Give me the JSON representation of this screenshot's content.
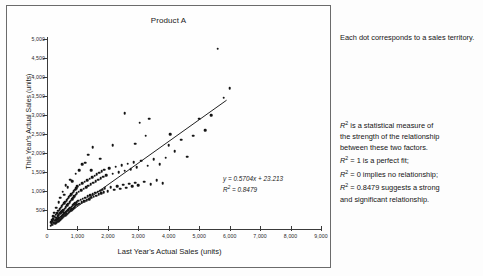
{
  "chart_data": {
    "type": "scatter",
    "title": "Product A",
    "xlabel": "Last Year's Actual Sales (units)",
    "ylabel": "This Year's Actual Sales (units)",
    "xlim": [
      0,
      9000
    ],
    "ylim": [
      0,
      5000
    ],
    "grid": false,
    "legend": "none",
    "x_ticks": [
      "0",
      "1,000",
      "2,000",
      "3,000",
      "4,000",
      "5,000",
      "6,000",
      "7,000",
      "8,000",
      "9,000"
    ],
    "x_tick_values": [
      0,
      1000,
      2000,
      3000,
      4000,
      5000,
      6000,
      7000,
      8000,
      9000
    ],
    "y_ticks": [
      "500",
      "1,000",
      "1,500",
      "2,000",
      "2,500",
      "3,000",
      "3,500",
      "4,000",
      "4,500",
      "5,000"
    ],
    "y_tick_values": [
      500,
      1000,
      1500,
      2000,
      2500,
      3000,
      3500,
      4000,
      4500,
      5000
    ],
    "trendline": {
      "slope": 0.5704,
      "intercept": 23.213,
      "r_squared": 0.8479,
      "equation_label": "y = 0.5704x + 23.213",
      "r2_label": "R² = 0.8479",
      "x_start": 150,
      "x_end": 5900
    },
    "series": [
      {
        "name": "Sales territories",
        "marker": "dot",
        "color": "#141414",
        "points": [
          [
            120,
            90
          ],
          [
            150,
            130
          ],
          [
            170,
            200
          ],
          [
            190,
            110
          ],
          [
            210,
            260
          ],
          [
            230,
            170
          ],
          [
            250,
            320
          ],
          [
            260,
            220
          ],
          [
            270,
            150
          ],
          [
            290,
            380
          ],
          [
            300,
            230
          ],
          [
            310,
            300
          ],
          [
            320,
            180
          ],
          [
            330,
            420
          ],
          [
            340,
            260
          ],
          [
            350,
            340
          ],
          [
            360,
            200
          ],
          [
            370,
            480
          ],
          [
            380,
            290
          ],
          [
            390,
            360
          ],
          [
            400,
            230
          ],
          [
            410,
            520
          ],
          [
            420,
            300
          ],
          [
            430,
            410
          ],
          [
            440,
            250
          ],
          [
            450,
            560
          ],
          [
            460,
            330
          ],
          [
            470,
            440
          ],
          [
            480,
            280
          ],
          [
            490,
            600
          ],
          [
            500,
            350
          ],
          [
            505,
            470
          ],
          [
            510,
            300
          ],
          [
            520,
            640
          ],
          [
            530,
            380
          ],
          [
            540,
            500
          ],
          [
            550,
            320
          ],
          [
            560,
            680
          ],
          [
            570,
            410
          ],
          [
            580,
            540
          ],
          [
            590,
            350
          ],
          [
            600,
            720
          ],
          [
            610,
            440
          ],
          [
            620,
            580
          ],
          [
            630,
            380
          ],
          [
            640,
            760
          ],
          [
            650,
            470
          ],
          [
            660,
            620
          ],
          [
            670,
            400
          ],
          [
            680,
            800
          ],
          [
            690,
            500
          ],
          [
            700,
            660
          ],
          [
            710,
            430
          ],
          [
            720,
            840
          ],
          [
            730,
            530
          ],
          [
            740,
            700
          ],
          [
            750,
            460
          ],
          [
            760,
            880
          ],
          [
            770,
            560
          ],
          [
            780,
            740
          ],
          [
            790,
            490
          ],
          [
            800,
            920
          ],
          [
            810,
            590
          ],
          [
            820,
            780
          ],
          [
            830,
            520
          ],
          [
            840,
            960
          ],
          [
            850,
            620
          ],
          [
            860,
            820
          ],
          [
            870,
            550
          ],
          [
            880,
            1000
          ],
          [
            890,
            650
          ],
          [
            900,
            860
          ],
          [
            910,
            580
          ],
          [
            920,
            1040
          ],
          [
            930,
            680
          ],
          [
            940,
            900
          ],
          [
            950,
            610
          ],
          [
            960,
            1080
          ],
          [
            970,
            710
          ],
          [
            980,
            940
          ],
          [
            990,
            640
          ],
          [
            1000,
            1120
          ],
          [
            1020,
            740
          ],
          [
            1040,
            980
          ],
          [
            1060,
            670
          ],
          [
            1080,
            1160
          ],
          [
            1100,
            770
          ],
          [
            1120,
            1020
          ],
          [
            1140,
            700
          ],
          [
            1160,
            1200
          ],
          [
            1180,
            800
          ],
          [
            1200,
            1060
          ],
          [
            1220,
            730
          ],
          [
            1240,
            1240
          ],
          [
            1260,
            830
          ],
          [
            1280,
            1100
          ],
          [
            1300,
            760
          ],
          [
            1320,
            1280
          ],
          [
            1340,
            860
          ],
          [
            1360,
            1140
          ],
          [
            1380,
            790
          ],
          [
            1400,
            1320
          ],
          [
            1420,
            890
          ],
          [
            1440,
            1180
          ],
          [
            1460,
            820
          ],
          [
            1480,
            1360
          ],
          [
            1500,
            920
          ],
          [
            1520,
            1220
          ],
          [
            1540,
            850
          ],
          [
            1560,
            1400
          ],
          [
            1580,
            950
          ],
          [
            1600,
            1260
          ],
          [
            1620,
            880
          ],
          [
            1640,
            1440
          ],
          [
            1660,
            980
          ],
          [
            1680,
            1300
          ],
          [
            1700,
            910
          ],
          [
            1720,
            1480
          ],
          [
            1740,
            1010
          ],
          [
            1760,
            1340
          ],
          [
            1780,
            940
          ],
          [
            1800,
            1520
          ],
          [
            1820,
            1040
          ],
          [
            1840,
            1380
          ],
          [
            1860,
            970
          ],
          [
            1880,
            1560
          ],
          [
            1900,
            1070
          ],
          [
            1950,
            1420
          ],
          [
            2000,
            1000
          ],
          [
            2050,
            1600
          ],
          [
            2100,
            1100
          ],
          [
            2150,
            1460
          ],
          [
            2200,
            1030
          ],
          [
            2250,
            1640
          ],
          [
            2300,
            1130
          ],
          [
            2350,
            1500
          ],
          [
            2400,
            1060
          ],
          [
            2450,
            1680
          ],
          [
            2500,
            1160
          ],
          [
            2550,
            1540
          ],
          [
            2600,
            1090
          ],
          [
            2650,
            1720
          ],
          [
            2700,
            1190
          ],
          [
            2750,
            1580
          ],
          [
            2800,
            1120
          ],
          [
            2850,
            1760
          ],
          [
            2900,
            1220
          ],
          [
            2950,
            1620
          ],
          [
            3000,
            1150
          ],
          [
            3100,
            1800
          ],
          [
            3200,
            1250
          ],
          [
            3300,
            1660
          ],
          [
            3400,
            1180
          ],
          [
            3500,
            1840
          ],
          [
            3600,
            1280
          ],
          [
            3700,
            1700
          ],
          [
            3800,
            1210
          ],
          [
            3900,
            1880
          ],
          [
            4000,
            2200
          ],
          [
            4200,
            2050
          ],
          [
            4400,
            2350
          ],
          [
            4600,
            1900
          ],
          [
            4800,
            2450
          ],
          [
            5000,
            2900
          ],
          [
            5200,
            2600
          ],
          [
            5400,
            3000
          ],
          [
            5600,
            4750
          ],
          [
            5800,
            3450
          ],
          [
            6000,
            3700
          ],
          [
            2550,
            3050
          ],
          [
            3050,
            2800
          ],
          [
            3350,
            2900
          ],
          [
            3250,
            2450
          ],
          [
            1500,
            2150
          ],
          [
            1350,
            1950
          ],
          [
            1150,
            1700
          ],
          [
            950,
            1450
          ],
          [
            760,
            1300
          ],
          [
            620,
            1150
          ],
          [
            520,
            980
          ],
          [
            430,
            830
          ],
          [
            2900,
            2250
          ],
          [
            2150,
            2200
          ],
          [
            1750,
            1850
          ],
          [
            4050,
            2500
          ],
          [
            820,
            1260
          ],
          [
            1050,
            1550
          ],
          [
            1250,
            1750
          ],
          [
            1450,
            1550
          ],
          [
            680,
            1100
          ],
          [
            560,
            900
          ],
          [
            380,
            700
          ],
          [
            300,
            560
          ],
          [
            240,
            430
          ],
          [
            200,
            340
          ],
          [
            160,
            250
          ],
          [
            130,
            180
          ]
        ]
      }
    ]
  },
  "notes": {
    "dot_note": "Each dot corresponds to a sales territory.",
    "r2_note_lines": [
      "is a statistical measure of",
      "the strength of the relationship",
      "between these two factors."
    ],
    "r2_bullets": [
      "= 1 is a perfect fit;",
      "= 0 implies no relationship;",
      "= 0.8479 suggests a strong",
      "and significant relationship."
    ],
    "r2_symbol": "R"
  }
}
